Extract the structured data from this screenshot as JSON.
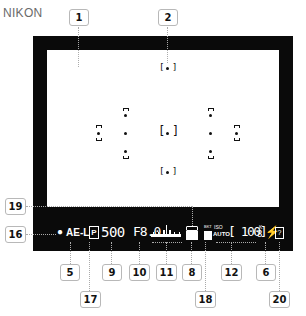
{
  "brand": "NIKON",
  "viewfinder": {
    "af_points": 11,
    "status_bar": {
      "ael_dot": "●",
      "ael": "AE-L",
      "program_icon": "P",
      "shutter": "500",
      "aperture": "F8.0",
      "exposure_scale": "exposure-indicator",
      "bracket_icon": "battery-icon",
      "wb_icon": "BKT",
      "iso_top": "ISO",
      "iso_auto": "AUTO",
      "shots_remaining": "[ 100]",
      "k_indicator": "K",
      "flash_icon": "flash-ready-icon",
      "help_icon": "?"
    }
  },
  "callouts": {
    "c1": "1",
    "c2": "2",
    "c19": "19",
    "c16": "16",
    "c5": "5",
    "c9": "9",
    "c10": "10",
    "c11": "11",
    "c8": "8",
    "c12": "12",
    "c6": "6",
    "c17": "17",
    "c18": "18",
    "c20": "20"
  }
}
